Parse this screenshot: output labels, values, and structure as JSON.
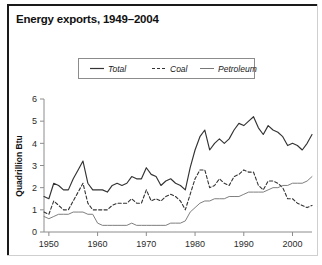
{
  "chart_data": {
    "type": "line",
    "title": "Energy exports, 1949–2004",
    "xlabel": "",
    "ylabel": "Quadrillion Btu",
    "xlim": [
      1949,
      2004
    ],
    "ylim": [
      0,
      6
    ],
    "grid": false,
    "legend_position": "top-center",
    "xticks": [
      1950,
      1960,
      1970,
      1980,
      1990,
      2000
    ],
    "yticks": [
      0,
      1,
      2,
      3,
      4,
      5,
      6
    ],
    "x": [
      1949,
      1950,
      1951,
      1952,
      1953,
      1954,
      1955,
      1956,
      1957,
      1958,
      1959,
      1960,
      1961,
      1962,
      1963,
      1964,
      1965,
      1966,
      1967,
      1968,
      1969,
      1970,
      1971,
      1972,
      1973,
      1974,
      1975,
      1976,
      1977,
      1978,
      1979,
      1980,
      1981,
      1982,
      1983,
      1984,
      1985,
      1986,
      1987,
      1988,
      1989,
      1990,
      1991,
      1992,
      1993,
      1994,
      1995,
      1996,
      1997,
      1998,
      1999,
      2000,
      2001,
      2002,
      2003,
      2004
    ],
    "series": [
      {
        "name": "Total",
        "style": "solid-thick",
        "color": "#333333",
        "values": [
          1.6,
          1.5,
          2.2,
          2.1,
          1.9,
          1.9,
          2.4,
          2.8,
          3.2,
          2.2,
          1.9,
          1.9,
          1.9,
          1.8,
          2.1,
          2.2,
          2.1,
          2.2,
          2.5,
          2.4,
          2.4,
          2.9,
          2.6,
          2.5,
          2.1,
          2.3,
          2.4,
          2.2,
          2.1,
          1.9,
          2.9,
          3.7,
          4.3,
          4.6,
          3.7,
          4.0,
          4.2,
          4.0,
          4.2,
          4.6,
          4.9,
          4.8,
          5.0,
          5.2,
          4.7,
          4.4,
          4.8,
          4.6,
          4.5,
          4.3,
          3.9,
          4.0,
          3.9,
          3.7,
          4.0,
          4.4
        ]
      },
      {
        "name": "Coal",
        "style": "dashed",
        "color": "#333333",
        "values": [
          0.9,
          0.8,
          1.4,
          1.2,
          1.0,
          1.0,
          1.4,
          1.8,
          2.2,
          1.3,
          1.0,
          1.0,
          1.0,
          1.0,
          1.2,
          1.3,
          1.3,
          1.3,
          1.5,
          1.3,
          1.3,
          1.9,
          1.4,
          1.5,
          1.4,
          1.6,
          1.7,
          1.6,
          1.4,
          1.0,
          1.7,
          2.4,
          2.8,
          2.8,
          2.0,
          2.1,
          2.4,
          2.2,
          2.1,
          2.5,
          2.6,
          2.8,
          2.7,
          2.7,
          2.1,
          1.9,
          2.3,
          2.3,
          2.2,
          2.0,
          1.5,
          1.5,
          1.3,
          1.2,
          1.1,
          1.2
        ]
      },
      {
        "name": "Petroleum",
        "style": "solid-thin",
        "color": "#777777",
        "values": [
          0.7,
          0.6,
          0.7,
          0.8,
          0.8,
          0.8,
          0.9,
          0.9,
          0.9,
          0.8,
          0.8,
          0.4,
          0.3,
          0.3,
          0.3,
          0.3,
          0.3,
          0.3,
          0.4,
          0.3,
          0.3,
          0.3,
          0.3,
          0.3,
          0.3,
          0.3,
          0.4,
          0.4,
          0.4,
          0.5,
          0.9,
          1.1,
          1.3,
          1.4,
          1.4,
          1.5,
          1.5,
          1.5,
          1.6,
          1.6,
          1.6,
          1.7,
          1.8,
          1.8,
          1.8,
          1.8,
          1.9,
          2.0,
          2.0,
          2.1,
          2.1,
          2.2,
          2.2,
          2.2,
          2.3,
          2.5
        ]
      }
    ]
  },
  "legend": {
    "items": [
      {
        "label": "Total"
      },
      {
        "label": "Coal"
      },
      {
        "label": "Petroleum"
      }
    ]
  }
}
